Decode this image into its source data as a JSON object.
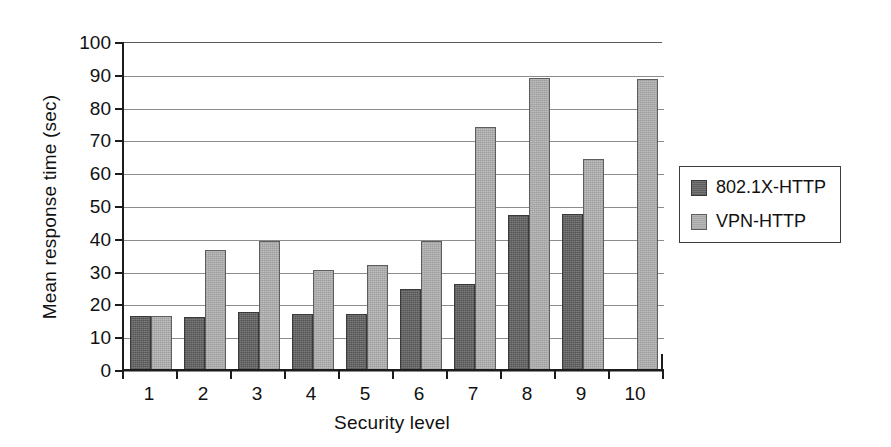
{
  "chart_data": {
    "type": "bar",
    "title": "",
    "xlabel": "Security level",
    "ylabel": "Mean response time (sec)",
    "categories": [
      "1",
      "2",
      "3",
      "4",
      "5",
      "6",
      "7",
      "8",
      "9",
      "10"
    ],
    "series": [
      {
        "name": "802.1X-HTTP",
        "color": "#6e6e6e",
        "values": [
          16.5,
          16.3,
          17.8,
          17.1,
          17.1,
          24.8,
          26.3,
          47.2,
          47.6,
          null
        ]
      },
      {
        "name": "VPN-HTTP",
        "color": "#b3b3b3",
        "values": [
          16.5,
          36.5,
          39.3,
          30.6,
          32.1,
          39.2,
          74.2,
          89.0,
          64.4,
          88.6
        ]
      }
    ],
    "ylim": [
      0,
      100
    ],
    "ytick_values": [
      0,
      10,
      20,
      30,
      40,
      50,
      60,
      70,
      80,
      90,
      100
    ],
    "ytick_labels": [
      "0",
      "10",
      "20",
      "30",
      "40",
      "50",
      "60",
      "70",
      "80",
      "90",
      "100"
    ],
    "grid": true,
    "grid_axis": "y",
    "legend_position": "right-outside"
  },
  "legend": {
    "entries": [
      {
        "label": "802.1X-HTTP"
      },
      {
        "label": "VPN-HTTP"
      }
    ]
  }
}
